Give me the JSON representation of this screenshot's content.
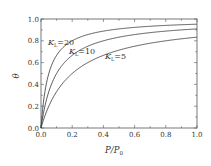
{
  "chart_data": {
    "type": "line",
    "title": "",
    "xlabel": "P/P0",
    "ylabel": "θ",
    "xlim": [
      0.0,
      1.0
    ],
    "ylim": [
      0.0,
      1.0
    ],
    "grid": false,
    "legend": "inline labels",
    "x_ticks": [
      "0.0",
      "0.2",
      "0.4",
      "0.6",
      "0.8",
      "1.0"
    ],
    "y_ticks": [
      "0.0",
      "0.2",
      "0.4",
      "0.6",
      "0.8",
      "1.0"
    ],
    "x": [
      0.0,
      0.01,
      0.02,
      0.04,
      0.06,
      0.08,
      0.1,
      0.15,
      0.2,
      0.3,
      0.4,
      0.5,
      0.6,
      0.7,
      0.8,
      0.9,
      1.0
    ],
    "series": [
      {
        "name": "K_L=20",
        "K": 20,
        "label_main": "K",
        "label_sub": "L",
        "label_rest": "=20",
        "values": [
          0.0,
          0.167,
          0.286,
          0.444,
          0.545,
          0.615,
          0.667,
          0.75,
          0.8,
          0.857,
          0.889,
          0.909,
          0.923,
          0.933,
          0.941,
          0.947,
          0.952
        ]
      },
      {
        "name": "K_L=10",
        "K": 10,
        "label_main": "K",
        "label_sub": "L",
        "label_rest": "=10",
        "values": [
          0.0,
          0.091,
          0.167,
          0.286,
          0.375,
          0.444,
          0.5,
          0.6,
          0.667,
          0.75,
          0.8,
          0.833,
          0.857,
          0.875,
          0.889,
          0.9,
          0.909
        ]
      },
      {
        "name": "K_L=5",
        "K": 5,
        "label_main": "K",
        "label_sub": "L",
        "label_rest": "=5",
        "values": [
          0.0,
          0.048,
          0.091,
          0.167,
          0.231,
          0.286,
          0.333,
          0.429,
          0.5,
          0.6,
          0.667,
          0.714,
          0.75,
          0.778,
          0.8,
          0.818,
          0.833
        ]
      }
    ],
    "annotations": [
      "K_L=20",
      "K_L=10",
      "K_L=5"
    ]
  },
  "labels": {
    "ylabel": "θ",
    "xlabel_main": "P/P",
    "xlabel_sub": "0"
  },
  "colors": {
    "line": "#333333",
    "frame": "#555555",
    "background": "#ffffff"
  }
}
